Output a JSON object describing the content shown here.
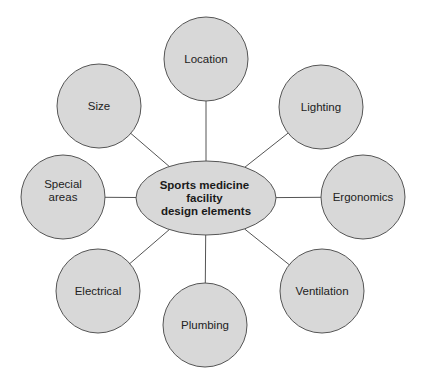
{
  "diagram": {
    "type": "hub-and-spoke",
    "colors": {
      "background": "#ffffff",
      "node_fill": "#d8d8d8",
      "node_stroke": "#555555",
      "text": "#222222"
    },
    "center": {
      "lines": [
        "Sports medicine",
        "facility",
        "design elements"
      ],
      "cx": 206,
      "cy": 198,
      "rx": 70,
      "ry": 37
    },
    "nodes": [
      {
        "id": "location",
        "label": [
          "Location"
        ],
        "cx": 206,
        "cy": 59,
        "r": 42
      },
      {
        "id": "lighting",
        "label": [
          "Lighting"
        ],
        "cx": 321,
        "cy": 107,
        "r": 42
      },
      {
        "id": "ergonomics",
        "label": [
          "Ergonomics"
        ],
        "cx": 363,
        "cy": 197,
        "r": 42
      },
      {
        "id": "ventilation",
        "label": [
          "Ventilation"
        ],
        "cx": 322,
        "cy": 291,
        "r": 42
      },
      {
        "id": "plumbing",
        "label": [
          "Plumbing"
        ],
        "cx": 205,
        "cy": 325,
        "r": 42
      },
      {
        "id": "electrical",
        "label": [
          "Electrical"
        ],
        "cx": 98,
        "cy": 291,
        "r": 42
      },
      {
        "id": "special-areas",
        "label": [
          "Special",
          "areas"
        ],
        "cx": 63,
        "cy": 197,
        "r": 42
      },
      {
        "id": "size",
        "label": [
          "Size"
        ],
        "cx": 99,
        "cy": 106,
        "r": 42
      }
    ]
  }
}
